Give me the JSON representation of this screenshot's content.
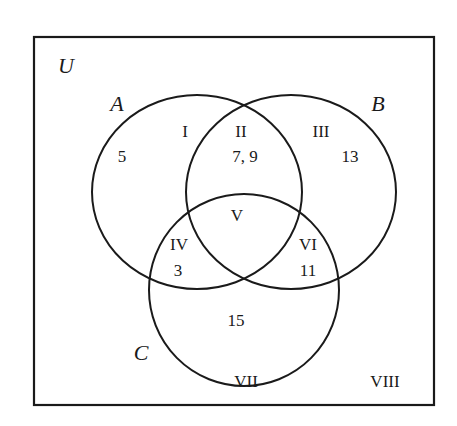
{
  "diagram": {
    "type": "venn",
    "universe": {
      "name": "U"
    },
    "sets": [
      {
        "name": "A"
      },
      {
        "name": "B"
      },
      {
        "name": "C"
      }
    ],
    "regions": [
      {
        "label": "I",
        "membership": "A only",
        "value": "5"
      },
      {
        "label": "II",
        "membership": "A and B only",
        "value": "7, 9"
      },
      {
        "label": "III",
        "membership": "B only",
        "value": "13"
      },
      {
        "label": "IV",
        "membership": "A and C only",
        "value": "3"
      },
      {
        "label": "V",
        "membership": "A and B and C",
        "value": ""
      },
      {
        "label": "VI",
        "membership": "B and C only",
        "value": "11"
      },
      {
        "label": "VII",
        "membership": "C only",
        "value": "15"
      },
      {
        "label": "VIII",
        "membership": "outside A, B, C",
        "value": ""
      }
    ]
  },
  "colors": {
    "stroke": "#1a1a1a",
    "background": "#ffffff"
  }
}
